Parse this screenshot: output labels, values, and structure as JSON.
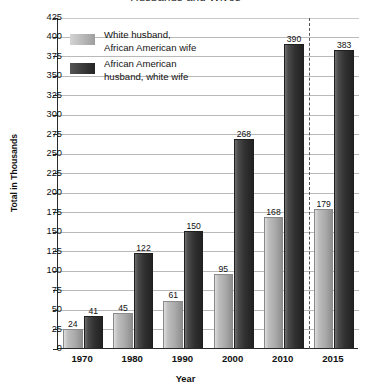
{
  "chart_data": {
    "type": "bar",
    "title": "Husbands and Wives",
    "xlabel": "Year",
    "ylabel": "Total in Thousands",
    "categories": [
      "1970",
      "1980",
      "1990",
      "2000",
      "2010",
      "2015"
    ],
    "series": [
      {
        "name": "White husband, African American wife",
        "color": "#a9a9a9",
        "values": [
          24,
          45,
          61,
          95,
          168,
          179
        ]
      },
      {
        "name": "African American husband, white wife",
        "color": "#313131",
        "values": [
          41,
          122,
          150,
          268,
          390,
          383
        ]
      }
    ],
    "ylim": [
      0,
      425
    ],
    "ytick_step": 25,
    "yticks": [
      0,
      25,
      50,
      75,
      100,
      125,
      150,
      175,
      200,
      225,
      250,
      275,
      300,
      325,
      350,
      375,
      400,
      425
    ],
    "grid": true,
    "legend_position": "top-left",
    "annotations": [
      {
        "type": "vertical-dashed-line",
        "between": [
          "2010",
          "2015"
        ]
      }
    ]
  },
  "legend": {
    "items": [
      {
        "label_line1": "White husband,",
        "label_line2": "African American wife"
      },
      {
        "label_line1": "African American",
        "label_line2": "husband, white wife"
      }
    ]
  }
}
